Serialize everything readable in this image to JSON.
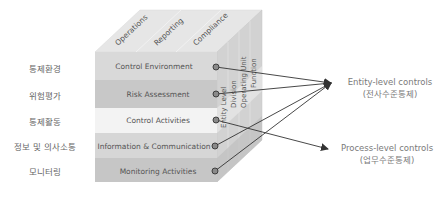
{
  "diagram": {
    "type": "coso-cube",
    "top_face": {
      "labels": [
        "Operations",
        "Reporting",
        "Compliance"
      ]
    },
    "side_face": {
      "labels": [
        "Entity Level",
        "Division",
        "Operating Unit",
        "Function"
      ]
    },
    "front_face": {
      "rows": [
        {
          "en": "Control Environment",
          "ko": "통제환경",
          "fill": "#d9d9d9"
        },
        {
          "en": "Risk Assessment",
          "ko": "위험평가",
          "fill": "#c8c8c8"
        },
        {
          "en": "Control Activities",
          "ko": "통제활동",
          "fill": "#f3f3f3"
        },
        {
          "en": "Information & Communication",
          "ko": "정보 및 의사소통",
          "fill": "#d6d6d6"
        },
        {
          "en": "Monitoring Activities",
          "ko": "모니터링",
          "fill": "#c6c6c6"
        }
      ]
    },
    "targets": {
      "entity": {
        "line1": "Entity-level controls",
        "line2": "(전사수준통제)"
      },
      "process": {
        "line1": "Process-level controls",
        "line2": "(업무수준통제)"
      }
    },
    "arrows": [
      {
        "from": "Control Environment",
        "to": "entity"
      },
      {
        "from": "Risk Assessment",
        "to": "entity"
      },
      {
        "from": "Control Activities",
        "to": "process"
      },
      {
        "from": "Information & Communication",
        "to": "entity"
      },
      {
        "from": "Monitoring Activities",
        "to": "entity"
      }
    ],
    "colors": {
      "top_face": "#e4e4e4",
      "side_face": "#cfcfcf",
      "text": "#555555",
      "arrow": "#333333",
      "dot_fill": "#8a8a8a"
    }
  }
}
